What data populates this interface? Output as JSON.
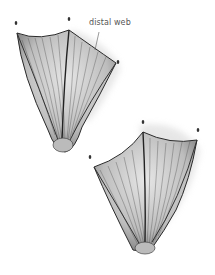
{
  "figure": {
    "annotation": {
      "label": "distal web"
    },
    "colors": {
      "background": "#ffffff",
      "ink": "#2a2a2a",
      "shade": "#8a8a8a",
      "label": "#555555"
    }
  }
}
